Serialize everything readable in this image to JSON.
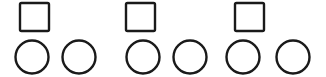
{
  "diagram": {
    "title": "Three squares each paired with two circles",
    "background_color": "#ffffff",
    "stroke_color": "#1a1a1a",
    "stroke_width": 2.4,
    "canvas": {
      "width": 326,
      "height": 77
    },
    "counts": {
      "squares": 3,
      "circles": 6,
      "groups": 3,
      "circles_per_group": 2
    },
    "rows": [
      {
        "name": "square-row",
        "shape": "square",
        "count": 3,
        "items": [
          {
            "label": "square-1",
            "x": 20,
            "y": 3,
            "width": 29,
            "height": 28
          },
          {
            "label": "square-2",
            "x": 126,
            "y": 3,
            "width": 29,
            "height": 28
          },
          {
            "label": "square-3",
            "x": 235,
            "y": 3,
            "width": 29,
            "height": 28
          }
        ]
      },
      {
        "name": "circle-row",
        "shape": "circle",
        "count": 6,
        "items": [
          {
            "label": "circle-1",
            "cx": 32,
            "cy": 57,
            "r": 16.5
          },
          {
            "label": "circle-2",
            "cx": 79,
            "cy": 57,
            "r": 16.5
          },
          {
            "label": "circle-3",
            "cx": 143,
            "cy": 57,
            "r": 16.5
          },
          {
            "label": "circle-4",
            "cx": 190,
            "cy": 57,
            "r": 16.5
          },
          {
            "label": "circle-5",
            "cx": 243,
            "cy": 57,
            "r": 16.5
          },
          {
            "label": "circle-6",
            "cx": 293,
            "cy": 57,
            "r": 16.5
          }
        ]
      }
    ]
  }
}
